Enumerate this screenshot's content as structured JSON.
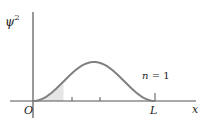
{
  "chart_data": {
    "type": "line",
    "title": "",
    "xlabel": "x",
    "ylabel": "ψ²",
    "ylabel_base": "ψ",
    "ylabel_sup": "2",
    "origin_label": "O",
    "x_tick_labels": [
      "O",
      "L"
    ],
    "annotation": "n = 1",
    "annotation_parts": {
      "var": "n",
      "eq": "= 1"
    },
    "xlim": [
      0,
      1
    ],
    "grid": false,
    "legend": "none",
    "series": [
      {
        "name": "ψ² (n = 1), ∝ sin²(πx/L)",
        "x": [
          0,
          0.125,
          0.25,
          0.375,
          0.5,
          0.625,
          0.75,
          0.875,
          1.0
        ],
        "values": [
          0,
          0.146,
          0.5,
          0.854,
          1.0,
          0.854,
          0.5,
          0.146,
          0
        ]
      }
    ],
    "shaded_region": {
      "x_from": 0,
      "x_to": 0.25,
      "color": "#e6e6e6"
    },
    "ticks_x": [
      0.25,
      0.5,
      1.0
    ],
    "colors": {
      "curve": "#808080",
      "axis": "#555555",
      "shade": "#e6e6e6",
      "text": "#222222"
    }
  }
}
